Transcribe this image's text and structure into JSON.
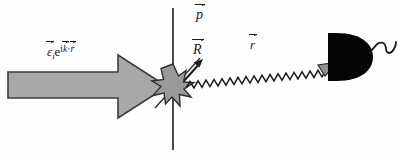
{
  "figure": {
    "name": "light-scattering-detection-diagram",
    "background_color": "#fefefe",
    "width": 398,
    "height": 161
  },
  "labels": {
    "incident_field": {
      "epsilon": "ε",
      "subscript": "i",
      "exp_base": "e",
      "exp_i": "i",
      "exp_k": "k",
      "exp_dot": "·",
      "exp_r": "r",
      "plain": "ε⃗ᵢ e^(i k⃗·r⃗)"
    },
    "dipole": {
      "symbol": "p",
      "plain": "p⃗"
    },
    "position_R": {
      "symbol": "R",
      "plain": "R⃗"
    },
    "position_r": {
      "symbol": "r",
      "plain": "r⃗"
    }
  },
  "elements": {
    "incident_arrow": "incident-beam-block-arrow",
    "scatter_point": "scattering-center-starburst",
    "interface_line": "vertical-interface-line",
    "scattered_wave": "scattered-wavy-ray",
    "detector": "photodetector-body",
    "detector_cable": "detector-cable"
  },
  "colors": {
    "arrow_fill": "#a8a8a8",
    "arrow_stroke": "#3c3c3c",
    "starburst_fill": "#9a9a9a",
    "line_stroke": "#2a2a2a",
    "detector_fill": "#050505",
    "text": "#1a1a1a"
  }
}
